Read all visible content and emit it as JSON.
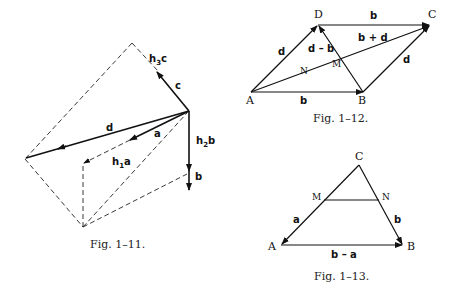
{
  "figures": [
    {
      "caption": "Fig. 1–11.",
      "labels": {
        "d": "d",
        "a": "a",
        "c": "c",
        "h1a_h": "h",
        "h1a_sub": "1",
        "h1a_v": "a",
        "h2b_h": "h",
        "h2b_sub": "2",
        "h2b_v": "b",
        "h3c_h": "h",
        "h3c_sub": "3",
        "h3c_v": "c",
        "b": "b"
      }
    },
    {
      "caption": "Fig. 1–12.",
      "points": {
        "A": "A",
        "B": "B",
        "C": "C",
        "D": "D",
        "M": "M",
        "N": "N"
      },
      "labels": {
        "top_b": "b",
        "bottom_b": "b",
        "left_d": "d",
        "right_d": "d",
        "d_minus_b": "d – b",
        "b_plus_d": "b + d"
      }
    },
    {
      "caption": "Fig. 1–13.",
      "points": {
        "A": "A",
        "B": "B",
        "C": "C",
        "M": "M",
        "N": "N"
      },
      "labels": {
        "a": "a",
        "b": "b",
        "b_minus_a": "b – a"
      }
    }
  ]
}
